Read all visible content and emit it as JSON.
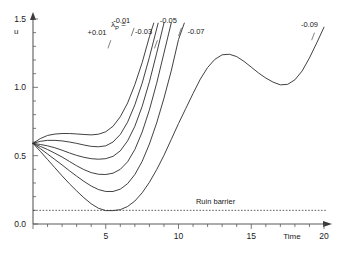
{
  "chart_data": {
    "type": "line",
    "title": "",
    "xlabel": "Time",
    "ylabel": "u",
    "xlim": [
      0,
      20
    ],
    "ylim": [
      0.0,
      1.5
    ],
    "grid": false,
    "legend_position": "inline-curve-labels",
    "xticks": [
      0,
      5,
      10,
      15,
      20
    ],
    "xtick_labels": [
      "",
      "5",
      "10",
      "15",
      "20"
    ],
    "yticks": [
      0.0,
      0.5,
      1.0,
      1.5
    ],
    "ytick_labels": [
      "0.0",
      "0.5",
      "1.0",
      "1.5"
    ],
    "minor_xtick_step": 1,
    "minor_ytick_step": 0.1,
    "legend_prefix": "λ",
    "legend_prefix_sub": "P",
    "legend_equals": "=",
    "annotations": [
      {
        "name": "lambda-legend",
        "text": "λP =",
        "x": 0.55,
        "y": 1.42
      },
      {
        "name": "ruin-barrier-label",
        "text": "Ruin barrier",
        "x": 11.3,
        "y": 0.18
      }
    ],
    "barrier": {
      "label": "Ruin barrier",
      "value": 0.1,
      "style": "dashed"
    },
    "series": [
      {
        "name": "+0.01",
        "label": "+0.01",
        "label_x": 4.4,
        "label_y": 1.38,
        "x": [
          0,
          0.5,
          1,
          1.5,
          2,
          2.5,
          3,
          3.5,
          4,
          4.5,
          5,
          5.5,
          6,
          6.5,
          7,
          7.5,
          8,
          8.3
        ],
        "y": [
          0.59,
          0.625,
          0.648,
          0.658,
          0.662,
          0.662,
          0.659,
          0.655,
          0.652,
          0.657,
          0.675,
          0.715,
          0.785,
          0.885,
          1.02,
          1.18,
          1.37,
          1.47
        ]
      },
      {
        "name": "-0.01",
        "label": "-0.01",
        "label_x": 6.1,
        "label_y": 1.47,
        "x": [
          0,
          0.5,
          1,
          1.5,
          2,
          2.5,
          3,
          3.5,
          4,
          4.5,
          5,
          5.5,
          6,
          6.5,
          7,
          7.5,
          8,
          8.6
        ],
        "y": [
          0.59,
          0.605,
          0.612,
          0.612,
          0.608,
          0.6,
          0.59,
          0.578,
          0.568,
          0.565,
          0.572,
          0.6,
          0.655,
          0.745,
          0.872,
          1.03,
          1.22,
          1.47
        ]
      },
      {
        "name": "-0.03",
        "label": "-0.03",
        "label_x": 7.6,
        "label_y": 1.39,
        "x": [
          0,
          0.5,
          1,
          1.5,
          2,
          2.5,
          3,
          3.5,
          4,
          4.5,
          5,
          5.5,
          6,
          6.5,
          7,
          7.5,
          8,
          8.5,
          9.0
        ],
        "y": [
          0.59,
          0.582,
          0.572,
          0.558,
          0.54,
          0.52,
          0.502,
          0.488,
          0.478,
          0.474,
          0.478,
          0.495,
          0.535,
          0.608,
          0.715,
          0.86,
          1.04,
          1.25,
          1.47
        ]
      },
      {
        "name": "-0.05",
        "label": "-0.05",
        "label_x": 9.3,
        "label_y": 1.47,
        "x": [
          0,
          0.5,
          1,
          1.5,
          2,
          2.5,
          3,
          3.5,
          4,
          4.5,
          5,
          5.5,
          6,
          6.5,
          7,
          7.5,
          8,
          8.5,
          9,
          9.5
        ],
        "y": [
          0.59,
          0.568,
          0.545,
          0.518,
          0.49,
          0.458,
          0.426,
          0.398,
          0.376,
          0.364,
          0.362,
          0.372,
          0.4,
          0.455,
          0.545,
          0.672,
          0.835,
          1.03,
          1.25,
          1.47
        ]
      },
      {
        "name": "-0.07",
        "label": "-0.07",
        "label_x": 11.2,
        "label_y": 1.39,
        "x": [
          0,
          0.5,
          1,
          1.5,
          2,
          2.5,
          3,
          3.5,
          4,
          4.5,
          5,
          5.5,
          6,
          6.5,
          7,
          7.5,
          8,
          8.5,
          9,
          9.5,
          10,
          10.4
        ],
        "y": [
          0.59,
          0.552,
          0.512,
          0.472,
          0.432,
          0.39,
          0.35,
          0.312,
          0.278,
          0.252,
          0.238,
          0.238,
          0.255,
          0.295,
          0.362,
          0.458,
          0.585,
          0.74,
          0.92,
          1.12,
          1.35,
          1.47
        ]
      },
      {
        "name": "-0.09",
        "label": "-0.09",
        "label_x": 19.0,
        "label_y": 1.44,
        "x": [
          0,
          0.5,
          1,
          1.5,
          2,
          2.5,
          3,
          3.5,
          4,
          4.5,
          5,
          5.5,
          6,
          6.5,
          7,
          7.5,
          8,
          8.5,
          9,
          9.5,
          10,
          10.5,
          11,
          11.5,
          12,
          12.5,
          13,
          13.5,
          14,
          14.5,
          15,
          15.5,
          16,
          16.5,
          17,
          17.5,
          18,
          18.5,
          19,
          19.5,
          20
        ],
        "y": [
          0.59,
          0.532,
          0.472,
          0.412,
          0.352,
          0.295,
          0.242,
          0.192,
          0.148,
          0.115,
          0.098,
          0.098,
          0.105,
          0.128,
          0.168,
          0.228,
          0.305,
          0.398,
          0.502,
          0.618,
          0.735,
          0.845,
          0.955,
          1.06,
          1.145,
          1.205,
          1.238,
          1.242,
          1.225,
          1.19,
          1.148,
          1.105,
          1.068,
          1.038,
          1.018,
          1.022,
          1.055,
          1.12,
          1.215,
          1.325,
          1.44
        ]
      }
    ]
  },
  "axis": {
    "y_label": "u",
    "x_label": "Time",
    "y_ticks": [
      "0.0",
      "0.5",
      "1.0",
      "1.5"
    ],
    "x_ticks": [
      "5",
      "10",
      "15",
      "20"
    ]
  }
}
